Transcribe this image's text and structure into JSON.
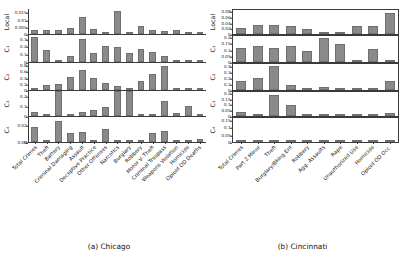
{
  "figure": {
    "panels": [
      {
        "caption": "(a) Chicago",
        "categories": [
          "Total Crimes",
          "Theft",
          "Battery",
          "Criminal Damaging",
          "Assault",
          "Deceptive Practice",
          "Other Offenses",
          "Narcotics",
          "Burglary",
          "Robbery",
          "Motor V. Theft",
          "Criminal Trespass",
          "Weapons Violation",
          "Homicide",
          "Opioid OD Deaths"
        ],
        "rows": [
          {
            "label": "Local",
            "ticks": [
              "0",
              "0.005",
              "0.01",
              "0.015"
            ],
            "ymax": 0.018,
            "values": [
              0.0032,
              0.0032,
              0.0032,
              0.004,
              0.012,
              0.0037,
              0.0,
              0.0168,
              0.0,
              0.0055,
              0.003,
              0.002,
              0.0032,
              0.0,
              0.0
            ]
          },
          {
            "label": "C₁",
            "ticks": [
              "0",
              "0.1",
              "0.2",
              "0.3"
            ],
            "ymax": 0.36,
            "values": [
              0.34,
              0.165,
              0.0,
              0.08,
              0.31,
              0.12,
              0.21,
              0.195,
              0.12,
              0.18,
              0.13,
              0.085,
              0.0,
              0.0,
              0.0
            ]
          },
          {
            "label": "C₂",
            "ticks": [
              "0",
              "0.2",
              "0.4",
              "0.6",
              "0.8"
            ],
            "ymax": 0.9,
            "values": [
              0.0,
              0.17,
              0.215,
              0.42,
              0.66,
              0.385,
              0.25,
              0.125,
              0.0,
              0.31,
              0.54,
              0.81,
              0.0,
              0.0,
              0.0
            ]
          },
          {
            "label": "C₃",
            "ticks": [
              "0",
              "0.1",
              "0.2"
            ],
            "ymax": 0.26,
            "values": [
              0.04,
              0.0,
              0.305,
              0.0,
              0.045,
              0.062,
              0.095,
              0.3,
              0.28,
              0.0,
              0.022,
              0.155,
              0.035,
              0.1,
              0.0
            ]
          },
          {
            "label": "C₄",
            "ticks": [
              "0",
              "0.00",
              "0.02"
            ],
            "ymax": 0.03,
            "values": [
              0.0178,
              0.0,
              0.0255,
              0.0105,
              0.0118,
              0.0,
              0.0158,
              0.0,
              0.0022,
              0.0,
              0.0105,
              0.0135,
              0.0,
              0.0,
              0.0035
            ]
          }
        ]
      },
      {
        "caption": "(b) Cincinnati",
        "categories": [
          "Total Crimes",
          "Part 2 Minor",
          "Theft",
          "Burglary/Bking Ent",
          "Robbery",
          "Agg. Assaults",
          "Rape",
          "Unauthorized Use",
          "Homicide",
          "Opioid OD Occ."
        ],
        "rows": [
          {
            "label": "Local",
            "ticks": [
              "0",
              "0.02",
              "0.04",
              "0.06",
              "0.08"
            ],
            "ymax": 0.092,
            "values": [
              0.024,
              0.035,
              0.034,
              0.032,
              0.021,
              0.001,
              0.0,
              0.03,
              0.031,
              0.08
            ]
          },
          {
            "label": "C₁",
            "ticks": [
              "0",
              "0.05",
              "0.1",
              "0.15",
              "0.2"
            ],
            "ymax": 0.225,
            "values": [
              0.118,
              0.135,
              0.122,
              0.14,
              0.098,
              0.205,
              0.155,
              0.0,
              0.11,
              0.0
            ]
          },
          {
            "label": "C₂",
            "ticks": [
              "0",
              "0.1",
              "0.2",
              "0.3",
              "0.4"
            ],
            "ymax": 0.46,
            "values": [
              0.155,
              0.205,
              0.42,
              0.095,
              0.022,
              0.048,
              0.012,
              0.018,
              0.0,
              0.16
            ]
          },
          {
            "label": "C₃",
            "ticks": [
              "0",
              "0.05",
              "0.1",
              "0.15",
              "0.2"
            ],
            "ymax": 0.225,
            "values": [
              0.035,
              0.0,
              0.195,
              0.105,
              0.0,
              0.022,
              0.0,
              0.018,
              0.0,
              0.025
            ]
          },
          {
            "label": "C₄",
            "ticks": [
              "0",
              "0.05",
              "0.1",
              "0.15"
            ],
            "ymax": 0.175,
            "values": [
              0.0,
              0.0,
              0.0,
              0.0,
              0.0,
              0.0,
              0.0,
              0.0,
              0.0,
              0.0
            ]
          }
        ]
      }
    ]
  },
  "chart_data": {
    "type": "bar",
    "title": "",
    "xlabel": "",
    "ylabel": "",
    "grid": false,
    "legend": null,
    "layout": "2 panels × 5 stacked subplots (Local, C1, C2, C3, C4); vertical bars; category labels rotated 45°",
    "charts": [
      {
        "panel": "(a) Chicago",
        "categories": [
          "Total Crimes",
          "Theft",
          "Battery",
          "Criminal Damaging",
          "Assault",
          "Deceptive Practice",
          "Other Offenses",
          "Narcotics",
          "Burglary",
          "Robbery",
          "Motor V. Theft",
          "Criminal Trespass",
          "Weapons Violation",
          "Homicide",
          "Opioid OD Deaths"
        ],
        "series": [
          {
            "name": "Local",
            "ylim": [
              0,
              0.018
            ],
            "yticks": [
              0,
              0.005,
              0.01,
              0.015
            ],
            "values": [
              0.0032,
              0.0032,
              0.0032,
              0.004,
              0.012,
              0.0037,
              0.0,
              0.0168,
              0.0,
              0.0055,
              0.003,
              0.002,
              0.0032,
              0.0,
              0.0
            ]
          },
          {
            "name": "C1",
            "ylim": [
              0,
              0.36
            ],
            "yticks": [
              0,
              0.1,
              0.2,
              0.3
            ],
            "values": [
              0.34,
              0.165,
              0.0,
              0.08,
              0.31,
              0.12,
              0.21,
              0.195,
              0.12,
              0.18,
              0.13,
              0.085,
              0.0,
              0.0,
              0.0
            ]
          },
          {
            "name": "C2",
            "ylim": [
              0,
              0.9
            ],
            "yticks": [
              0,
              0.2,
              0.4,
              0.6,
              0.8
            ],
            "values": [
              0.0,
              0.17,
              0.215,
              0.42,
              0.66,
              0.385,
              0.25,
              0.125,
              0.0,
              0.31,
              0.54,
              0.81,
              0.0,
              0.0,
              0.0
            ]
          },
          {
            "name": "C3",
            "ylim": [
              0,
              0.26
            ],
            "yticks": [
              0,
              0.1,
              0.2
            ],
            "values": [
              0.04,
              0.0,
              0.305,
              0.0,
              0.045,
              0.062,
              0.095,
              0.3,
              0.28,
              0.0,
              0.022,
              0.155,
              0.035,
              0.1,
              0.0
            ]
          },
          {
            "name": "C4",
            "ylim": [
              0,
              0.03
            ],
            "yticks": [
              0,
              0.0,
              0.02
            ],
            "values": [
              0.0178,
              0.0,
              0.0255,
              0.0105,
              0.0118,
              0.0,
              0.0158,
              0.0,
              0.0022,
              0.0,
              0.0105,
              0.0135,
              0.0,
              0.0,
              0.0035
            ]
          }
        ]
      },
      {
        "panel": "(b) Cincinnati",
        "categories": [
          "Total Crimes",
          "Part 2 Minor",
          "Theft",
          "Burglary/Bking Ent",
          "Robbery",
          "Agg. Assaults",
          "Rape",
          "Unauthorized Use",
          "Homicide",
          "Opioid OD Occ."
        ],
        "series": [
          {
            "name": "Local",
            "ylim": [
              0,
              0.092
            ],
            "yticks": [
              0,
              0.02,
              0.04,
              0.06,
              0.08
            ],
            "values": [
              0.024,
              0.035,
              0.034,
              0.032,
              0.021,
              0.001,
              0.0,
              0.03,
              0.031,
              0.08
            ]
          },
          {
            "name": "C1",
            "ylim": [
              0,
              0.225
            ],
            "yticks": [
              0,
              0.05,
              0.1,
              0.15,
              0.2
            ],
            "values": [
              0.118,
              0.135,
              0.122,
              0.14,
              0.098,
              0.205,
              0.155,
              0.0,
              0.11,
              0.0
            ]
          },
          {
            "name": "C2",
            "ylim": [
              0,
              0.46
            ],
            "yticks": [
              0,
              0.1,
              0.2,
              0.3,
              0.4
            ],
            "values": [
              0.155,
              0.205,
              0.42,
              0.095,
              0.022,
              0.048,
              0.012,
              0.018,
              0.0,
              0.16
            ]
          },
          {
            "name": "C3",
            "ylim": [
              0,
              0.225
            ],
            "yticks": [
              0,
              0.05,
              0.1,
              0.15,
              0.2
            ],
            "values": [
              0.035,
              0.0,
              0.195,
              0.105,
              0.0,
              0.022,
              0.0,
              0.018,
              0.0,
              0.025
            ]
          },
          {
            "name": "C4",
            "ylim": [
              0,
              0.175
            ],
            "yticks": [
              0,
              0.05,
              0.1,
              0.15
            ],
            "values": [
              0.0,
              0.0,
              0.0,
              0.0,
              0.0,
              0.0,
              0.0,
              0.0,
              0.0,
              0.0
            ]
          }
        ]
      }
    ]
  }
}
